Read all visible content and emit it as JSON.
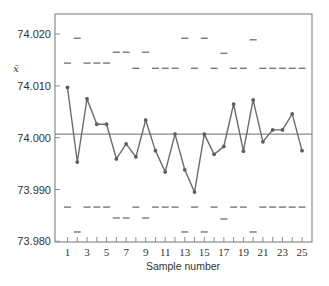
{
  "chart_data": {
    "type": "line",
    "title": "",
    "xlabel": "Sample number",
    "ylabel": "x̄",
    "x": [
      1,
      2,
      3,
      4,
      5,
      6,
      7,
      8,
      9,
      10,
      11,
      12,
      13,
      14,
      15,
      16,
      17,
      18,
      19,
      20,
      21,
      22,
      23,
      24,
      25
    ],
    "xticks": [
      1,
      3,
      5,
      7,
      9,
      11,
      13,
      15,
      17,
      19,
      21,
      23,
      25
    ],
    "yticks": [
      74.02,
      74.01,
      74.0,
      73.99,
      73.98
    ],
    "ytick_labels": [
      "74.020",
      "74.010",
      "74.000",
      "73.990",
      "73.980"
    ],
    "ylim": [
      73.98,
      74.022
    ],
    "xlim": [
      0.2,
      25.7
    ],
    "grid": false,
    "legend": null,
    "series": [
      {
        "name": "Sample mean",
        "values": [
          74.0097,
          73.9953,
          74.0075,
          74.0026,
          74.0026,
          73.9959,
          73.9988,
          73.9963,
          74.0034,
          73.9975,
          73.9934,
          74.0007,
          73.9938,
          73.9895,
          74.0007,
          73.9968,
          73.9983,
          74.0065,
          73.9974,
          74.0073,
          73.9992,
          74.0015,
          74.0015,
          74.0046,
          73.9975
        ]
      }
    ],
    "center_line": 74.0007,
    "upper_control_limits": [
      74.0144,
      74.0192,
      74.0144,
      74.0144,
      74.0144,
      74.0165,
      74.0165,
      74.0134,
      74.0165,
      74.0134,
      74.0134,
      74.0134,
      74.0192,
      74.0134,
      74.0192,
      74.0134,
      74.0163,
      74.0134,
      74.0134,
      74.0189,
      74.0134,
      74.0134,
      74.0134,
      74.0134,
      74.0134
    ],
    "lower_control_limits": [
      73.9866,
      73.9818,
      73.9866,
      73.9866,
      73.9866,
      73.9845,
      73.9845,
      73.9866,
      73.9845,
      73.9866,
      73.9866,
      73.9866,
      73.9818,
      73.9866,
      73.9818,
      73.9866,
      73.9843,
      73.9866,
      73.9866,
      73.9818,
      73.9866,
      73.9866,
      73.9866,
      73.9866,
      73.9866
    ]
  },
  "style": {
    "line_color": "#6b6b6b",
    "marker_color": "#5e5e5e",
    "limit_color": "#6e6e6e",
    "center_color": "#8a8a8a",
    "frame_color": "#8c8c8c",
    "text_color": "#333333"
  }
}
